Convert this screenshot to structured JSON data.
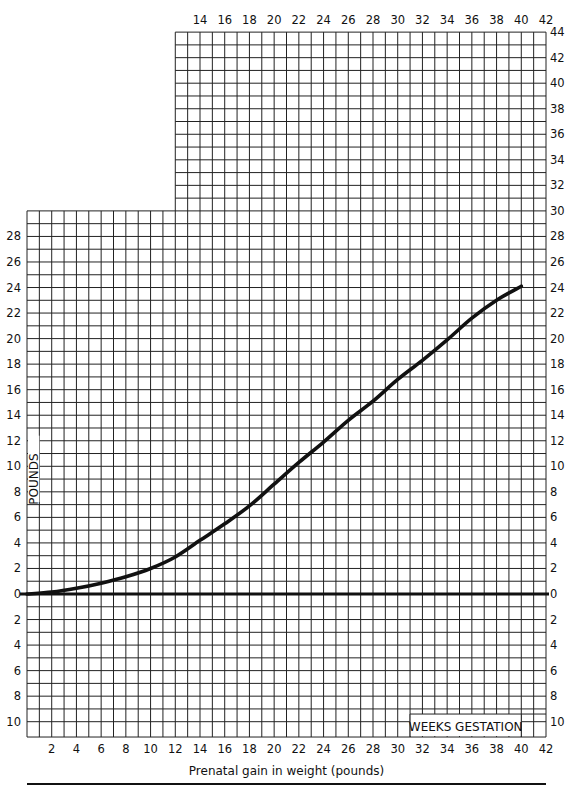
{
  "chart_data": {
    "type": "line",
    "title": "",
    "xlabel": "WEEKS GESTATION",
    "ylabel": "POUNDS",
    "caption": "Prenatal gain in weight (pounds)",
    "xlim": [
      0,
      42
    ],
    "ylim": [
      -11,
      44
    ],
    "grid": true,
    "x_ticks_top": [
      14,
      16,
      18,
      20,
      22,
      24,
      26,
      28,
      30,
      32,
      34,
      36,
      38,
      40,
      42
    ],
    "x_ticks_bottom": [
      2,
      4,
      6,
      8,
      10,
      12,
      14,
      16,
      18,
      20,
      22,
      24,
      26,
      28,
      30,
      32,
      34,
      36,
      38,
      40,
      42
    ],
    "y_ticks_left": [
      "28",
      "26",
      "24",
      "22",
      "20",
      "18",
      "16",
      "14",
      "12",
      "10",
      "8",
      "6",
      "4",
      "2",
      "0",
      "2",
      "4",
      "6",
      "8",
      "10"
    ],
    "y_ticks_right": [
      "44",
      "42",
      "40",
      "38",
      "36",
      "34",
      "32",
      "30",
      "28",
      "26",
      "24",
      "22",
      "20",
      "18",
      "16",
      "14",
      "12",
      "10",
      "8",
      "6",
      "4",
      "2",
      "0",
      "2",
      "4",
      "6",
      "8",
      "10"
    ],
    "grid_regions": {
      "lower": {
        "x": [
          0,
          42
        ],
        "y": [
          -11,
          30
        ]
      },
      "upper": {
        "x": [
          12,
          42
        ],
        "y": [
          30,
          44
        ]
      }
    },
    "baseline": 0,
    "series": [
      {
        "name": "Prenatal weight gain",
        "x": [
          0,
          2,
          4,
          6,
          8,
          10,
          12,
          14,
          16,
          18,
          20,
          22,
          24,
          26,
          28,
          30,
          32,
          34,
          36,
          38,
          40
        ],
        "values": [
          0,
          0.15,
          0.45,
          0.85,
          1.35,
          2.0,
          2.9,
          4.2,
          5.5,
          6.9,
          8.6,
          10.3,
          11.9,
          13.6,
          15.1,
          16.8,
          18.3,
          19.9,
          21.6,
          23.0,
          24.1
        ]
      }
    ]
  },
  "labels": {
    "pounds": "POUNDS",
    "weeks_gestation": "WEEKS GESTATION",
    "caption": "Prenatal gain in weight (pounds)"
  }
}
